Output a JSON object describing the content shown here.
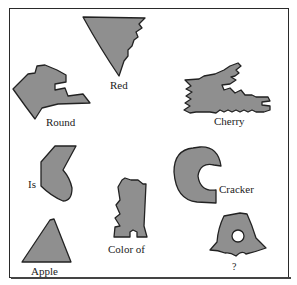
{
  "figure": {
    "type": "shape-word puzzle",
    "shape_fill": "#8f8f8f",
    "shape_stroke": "#222222",
    "border_color": "#2a2a2a",
    "items": [
      {
        "id": "red",
        "label": "Red",
        "shape": "inverted-triangle-jagged-right"
      },
      {
        "id": "round",
        "label": "Round",
        "shape": "jagged-arrow-left"
      },
      {
        "id": "cherry",
        "label": "Cherry",
        "shape": "notched-comb"
      },
      {
        "id": "is",
        "label": "Is",
        "shape": "bent-blob"
      },
      {
        "id": "cracker",
        "label": "Cracker",
        "shape": "c-shape"
      },
      {
        "id": "color-of",
        "label": "Color of",
        "shape": "notched-rectangle"
      },
      {
        "id": "apple",
        "label": "Apple",
        "shape": "triangle"
      },
      {
        "id": "question",
        "label": "?",
        "shape": "bell-with-hole"
      }
    ]
  }
}
